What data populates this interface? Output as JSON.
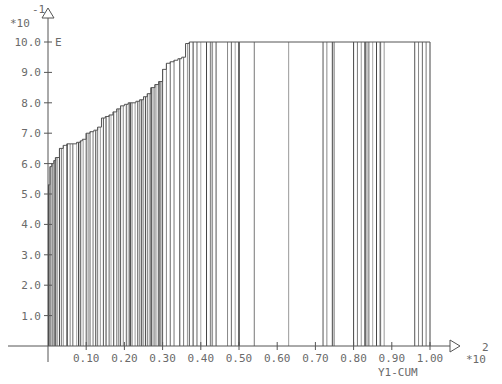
{
  "chart_data": {
    "type": "line",
    "subtype": "step-with-vertical-drop-lines",
    "title": "",
    "xlabel": "Y1-CUM",
    "ylabel": "E",
    "x_multiplier": "*10",
    "x_exponent": "2",
    "y_multiplier": "*10",
    "y_exponent": "-1",
    "xlim": [
      0,
      1.05
    ],
    "ylim": [
      0,
      10.5
    ],
    "grid": false,
    "legend": null,
    "x_ticks": [
      "0.10",
      "0.20",
      "0.30",
      "0.40",
      "0.50",
      "0.60",
      "0.70",
      "0.80",
      "0.90",
      "1.00"
    ],
    "y_ticks": [
      "1.0",
      "2.0",
      "3.0",
      "4.0",
      "5.0",
      "6.0",
      "7.0",
      "8.0",
      "9.0",
      "10.0"
    ],
    "series": [
      {
        "name": "E",
        "x": [
          0.0,
          0.005,
          0.01,
          0.015,
          0.02,
          0.03,
          0.04,
          0.045,
          0.05,
          0.06,
          0.075,
          0.085,
          0.09,
          0.1,
          0.11,
          0.12,
          0.13,
          0.14,
          0.15,
          0.16,
          0.17,
          0.18,
          0.19,
          0.2,
          0.21,
          0.22,
          0.23,
          0.24,
          0.25,
          0.26,
          0.27,
          0.28,
          0.29,
          0.3,
          0.31,
          0.32,
          0.33,
          0.34,
          0.35,
          0.36,
          0.37,
          1.0
        ],
        "y": [
          5.3,
          5.9,
          6.0,
          6.1,
          6.2,
          6.5,
          6.6,
          6.6,
          6.65,
          6.65,
          6.7,
          6.75,
          6.8,
          7.0,
          7.05,
          7.1,
          7.2,
          7.5,
          7.55,
          7.6,
          7.7,
          7.8,
          7.9,
          7.95,
          8.0,
          8.0,
          8.05,
          8.1,
          8.2,
          8.3,
          8.5,
          8.6,
          8.7,
          9.1,
          9.3,
          9.35,
          9.4,
          9.45,
          9.5,
          9.95,
          10.0,
          10.0
        ]
      }
    ],
    "drop_lines_x": [
      0.002,
      0.006,
      0.01,
      0.013,
      0.017,
      0.02,
      0.025,
      0.03,
      0.035,
      0.04,
      0.05,
      0.058,
      0.065,
      0.075,
      0.08,
      0.085,
      0.092,
      0.1,
      0.105,
      0.11,
      0.118,
      0.125,
      0.13,
      0.137,
      0.145,
      0.152,
      0.16,
      0.165,
      0.172,
      0.18,
      0.185,
      0.19,
      0.197,
      0.205,
      0.21,
      0.215,
      0.22,
      0.228,
      0.235,
      0.24,
      0.245,
      0.25,
      0.255,
      0.26,
      0.265,
      0.27,
      0.275,
      0.28,
      0.285,
      0.29,
      0.293,
      0.296,
      0.3,
      0.31,
      0.32,
      0.33,
      0.345,
      0.355,
      0.365,
      0.37,
      0.38,
      0.39,
      0.4,
      0.415,
      0.425,
      0.43,
      0.44,
      0.47,
      0.48,
      0.49,
      0.5,
      0.54,
      0.63,
      0.72,
      0.73,
      0.745,
      0.75,
      0.8,
      0.81,
      0.82,
      0.83,
      0.835,
      0.84,
      0.85,
      0.86,
      0.87,
      0.88,
      0.96,
      0.97,
      0.98,
      0.99,
      1.0
    ]
  },
  "labels": {
    "y_axis_label": "E",
    "y_exponent": "-1",
    "y_multiplier": "*10",
    "x_axis_label": "Y1-CUM",
    "x_exponent": "2",
    "x_multiplier": "*10"
  }
}
